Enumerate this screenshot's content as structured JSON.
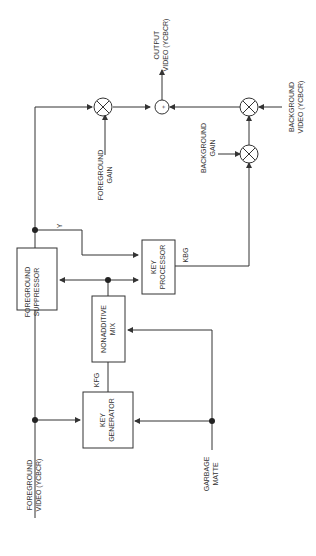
{
  "diagram": {
    "blocks": {
      "foreground_suppressor": [
        "FOREGROUND",
        "SUPPRESSOR"
      ],
      "key_processor": [
        "KEY",
        "PROCESSOR"
      ],
      "nonadditive_mix": [
        "NONADDITIVE",
        "MIX"
      ],
      "key_generator": [
        "KEY",
        "GENERATOR"
      ]
    },
    "inputs": {
      "foreground_video": [
        "FOREGROUND",
        "VIDEO (YCBCR)"
      ],
      "garbage_matte": [
        "GARBAGE",
        "MATTE"
      ],
      "background_video": [
        "BACKGROUND",
        "VIDEO (YCBCR)"
      ],
      "foreground_gain": [
        "FOREGROUND",
        "GAIN"
      ],
      "background_gain": [
        "BACKGROUND",
        "GAIN"
      ]
    },
    "outputs": {
      "output_video": [
        "OUTPUT",
        "VIDEO (YCBCR)"
      ]
    },
    "signals": {
      "y": "Y",
      "kbg": "KBG",
      "kfg": "KFG"
    },
    "symbols": {
      "sum": "+",
      "multiply": "×"
    }
  }
}
